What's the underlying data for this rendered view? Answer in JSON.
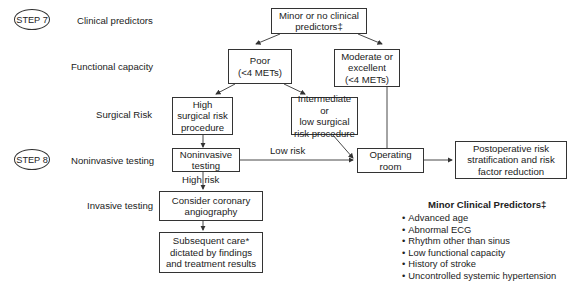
{
  "steps": [
    {
      "label": "STEP 7"
    },
    {
      "label": "STEP 8"
    }
  ],
  "row_labels": {
    "clinical": "Clinical predictors",
    "functional": "Functional capacity",
    "surgical": "Surgical Risk",
    "noninvasive": "Noninvasive testing",
    "invasive": "Invasive testing"
  },
  "nodes": {
    "minor": {
      "line1": "Minor or no clinical",
      "line2": "predictors‡"
    },
    "poor": {
      "line1": "Poor",
      "line2": "(<4 METs)"
    },
    "moderate": {
      "line1": "Moderate or",
      "line2": "excellent",
      "line3": "(<4 METs)"
    },
    "high_risk": {
      "line1": "High",
      "line2": "surgical risk",
      "line3": "procedure"
    },
    "intermediate": {
      "line1": "Intermediate or",
      "line2": "low surgical",
      "line3": "risk procedure"
    },
    "noninvasive": {
      "line1": "Noninvasive",
      "line2": "testing"
    },
    "operating": {
      "line1": "Operating",
      "line2": "room"
    },
    "postop": {
      "line1": "Postoperative risk",
      "line2": "stratification and risk",
      "line3": "factor reduction"
    },
    "angiography": {
      "line1": "Consider coronary",
      "line2": "angiography"
    },
    "subsequent": {
      "line1": "Subsequent care*",
      "line2": "dictated by findings",
      "line3": "and treatment results"
    }
  },
  "edge_labels": {
    "low_risk": "Low risk",
    "high_risk": "High risk"
  },
  "legend": {
    "title": "Minor Clinical Predictors‡",
    "items": [
      "Advanced age",
      "Abnormal ECG",
      "Rhythm other than sinus",
      "Low functional capacity",
      "History of stroke",
      "Uncontrolled systemic hypertension"
    ]
  }
}
